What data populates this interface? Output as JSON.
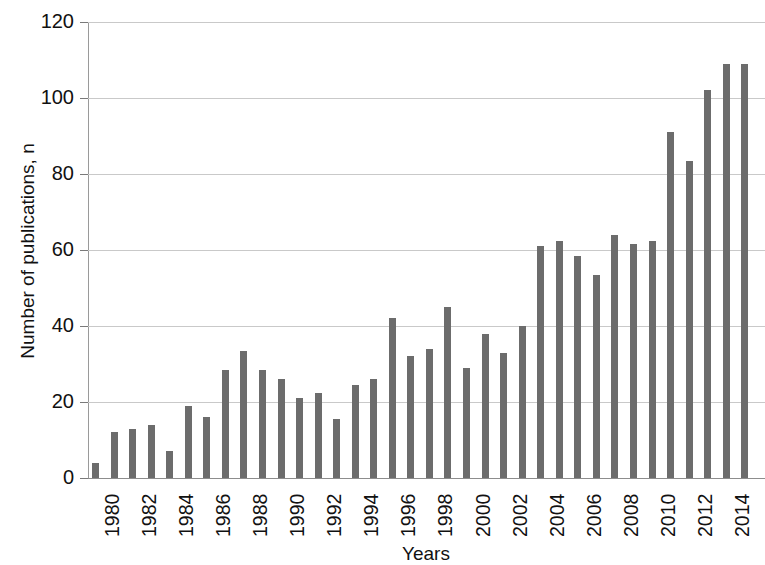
{
  "chart_data": {
    "type": "bar",
    "title": "",
    "xlabel": "Years",
    "ylabel": "Number of publications, n",
    "ylim": [
      0,
      120
    ],
    "ytick_values": [
      0,
      20,
      40,
      60,
      80,
      100,
      120
    ],
    "ytick_labels": [
      "0",
      "20",
      "40",
      "60",
      "80",
      "100",
      "120"
    ],
    "grid": true,
    "legend": "none",
    "bar_color": "#6c6c6c",
    "gridline_color": "#c9c9c9",
    "axis_color": "#8d8d8d",
    "xtick_label_interval": 2,
    "xtick_labels": [
      "1980",
      "1982",
      "1984",
      "1986",
      "1988",
      "1990",
      "1992",
      "1994",
      "1996",
      "1998",
      "2000",
      "2002",
      "2004",
      "2006",
      "2008",
      "2010",
      "2012",
      "2014"
    ],
    "categories": [
      "1980",
      "1981",
      "1982",
      "1983",
      "1984",
      "1985",
      "1986",
      "1987",
      "1988",
      "1989",
      "1990",
      "1991",
      "1992",
      "1993",
      "1994",
      "1995",
      "1996",
      "1997",
      "1998",
      "1999",
      "2000",
      "2001",
      "2002",
      "2003",
      "2004",
      "2005",
      "2006",
      "2007",
      "2008",
      "2009",
      "2010",
      "2011",
      "2012",
      "2013",
      "2014",
      "2015"
    ],
    "values": [
      4,
      12,
      13,
      14,
      7,
      19,
      16,
      28.5,
      33.5,
      28.5,
      26,
      21,
      22.5,
      15.5,
      24.5,
      26,
      42,
      32,
      34,
      45,
      29,
      38,
      33,
      40,
      61,
      62.5,
      58.5,
      53.5,
      64,
      61.5,
      62.5,
      91,
      83.5,
      102,
      109,
      109
    ],
    "note_cropped_right": "rightmost bar clipped by image edge"
  }
}
